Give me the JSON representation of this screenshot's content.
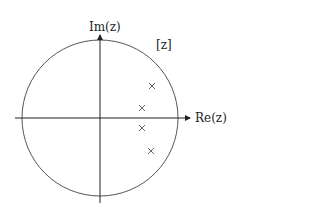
{
  "diagram": {
    "type": "z-plane pole plot",
    "plane_label": "[z]",
    "axes": {
      "horizontal_label": "Re(z)",
      "vertical_label": "Im(z)"
    },
    "unit_circle": {
      "center": [
        100,
        118
      ],
      "radius": 78
    },
    "poles": [
      {
        "marker": "×",
        "x": 152,
        "y": 86
      },
      {
        "marker": "×",
        "x": 142,
        "y": 108
      },
      {
        "marker": "×",
        "x": 142,
        "y": 128
      },
      {
        "marker": "×",
        "x": 151,
        "y": 151
      }
    ],
    "colors": {
      "line": "#333333",
      "circle": "#555555",
      "marker": "#555555"
    }
  }
}
